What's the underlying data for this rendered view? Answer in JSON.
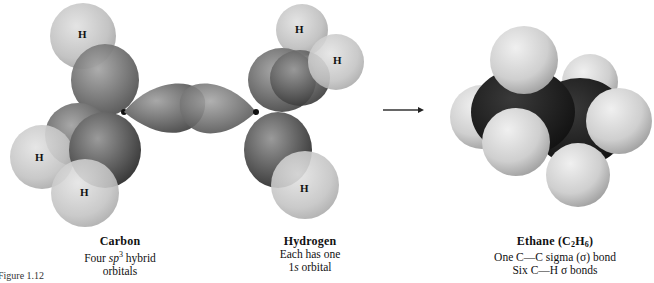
{
  "diagram": {
    "type": "orbital-overlap-formation",
    "arrow": "reaction-arrow",
    "left_molecule": {
      "h_labels": [
        "H",
        "H",
        "H",
        "H",
        "H",
        "H"
      ]
    },
    "captions": {
      "carbon": {
        "title": "Carbon",
        "line1_prefix": "Four ",
        "line1_italic": "sp",
        "line1_sup": "3",
        "line1_suffix": " hybrid",
        "line2": "orbitals"
      },
      "hydrogen": {
        "title": "Hydrogen",
        "line1": "Each has one",
        "line2_num": "1",
        "line2_italic": "s",
        "line2_suffix": " orbital"
      },
      "ethane": {
        "title_prefix": "Ethane (C",
        "title_sub1": "2",
        "title_mid": "H",
        "title_sub2": "6",
        "title_suffix": ")",
        "line1": "One C—C sigma (σ) bond",
        "line2": "Six C—H σ bonds"
      }
    },
    "figure_label": "Figure 1.12"
  },
  "colors": {
    "hydrogen_sphere": "#c9c9c9",
    "sp3_lobe": "#7a7a7a",
    "ethane_carbon": "#1c1c1c",
    "ethane_hydrogen": "#d4d4d4",
    "text": "#111111"
  }
}
